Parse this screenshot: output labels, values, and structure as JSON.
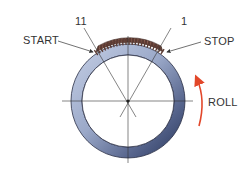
{
  "diagram": {
    "type": "pipe-weld-position",
    "labels": {
      "start": "START",
      "stop": "STOP",
      "roll": "ROLL",
      "clock_left": "11",
      "clock_right": "1"
    },
    "colors": {
      "ring_light": "#c6d0e6",
      "ring_mid": "#8c9cc0",
      "ring_dark": "#27355a",
      "ring_outline": "#2a2f45",
      "weld_bead": "#5c3b33",
      "weld_bead_highlight": "#9a6a5c",
      "roll_arrow": "#e2472a",
      "guide_line": "#333333",
      "text": "#333333"
    }
  }
}
